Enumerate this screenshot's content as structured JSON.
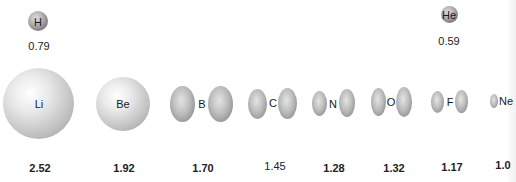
{
  "elements": [
    {
      "symbol": "H",
      "radius": "0.79",
      "shape": "sphere"
    },
    {
      "symbol": "He",
      "radius": "0.59",
      "shape": "sphere"
    },
    {
      "symbol": "Li",
      "radius": "2.52",
      "shape": "sphere"
    },
    {
      "symbol": "Be",
      "radius": "1.92",
      "shape": "sphere"
    },
    {
      "symbol": "B",
      "radius": "1.70",
      "shape": "dumbbell"
    },
    {
      "symbol": "C",
      "radius": "1.45",
      "shape": "dumbbell"
    },
    {
      "symbol": "N",
      "radius": "1.28",
      "shape": "dumbbell"
    },
    {
      "symbol": "O",
      "radius": "1.32",
      "shape": "dumbbell"
    },
    {
      "symbol": "F",
      "radius": "1.17",
      "shape": "dumbbell"
    },
    {
      "symbol": "Ne",
      "radius": "1.0",
      "shape": "dumbbell"
    }
  ]
}
